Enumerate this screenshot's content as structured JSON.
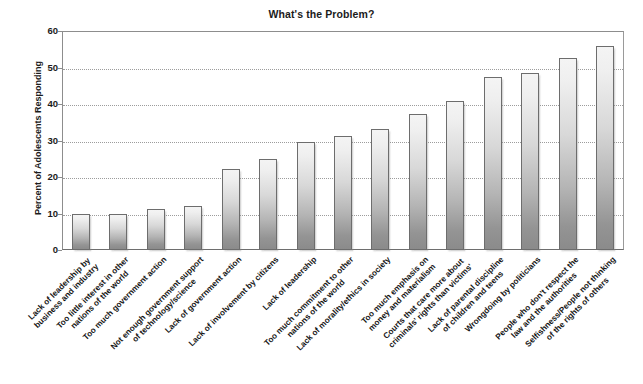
{
  "chart_data": {
    "type": "bar",
    "title": "What's the Problem?",
    "xlabel": "",
    "ylabel": "Percent of Adolescents Responding",
    "ylim": [
      0,
      60
    ],
    "ytick_step": 10,
    "yticks": [
      "60",
      "50",
      "40",
      "30",
      "20",
      "10",
      "0"
    ],
    "grid": "horizontal-dotted",
    "legend": "none",
    "categories": [
      "Lack of leadership by\nbusiness and industry",
      "Too little interest in other\nnations of the world",
      "Too much government action",
      "Not enough government support\nof technology/science",
      "Lack of government action",
      "Lack of involvement by citizens",
      "Lack of leadership",
      "Too much commitment to other\nnations of the world",
      "Lack of morality/ethics in society",
      "Too much emphasis on\nmoney and materialism",
      "Courts that care more about\ncriminals' rights than victims'",
      "Lack of parental discipline\nof children and teens",
      "Wrongdoing by politicians",
      "People who don't respect the\nlaw and the authorities",
      "Selfishness/People not thinking\nof the rights of others"
    ],
    "values": [
      9.8,
      10.0,
      11.3,
      12.0,
      22.3,
      24.8,
      29.7,
      31.2,
      33.2,
      37.3,
      40.8,
      47.5,
      48.5,
      52.5,
      56.0
    ],
    "bar_fill_top": "#f4f4f4",
    "bar_fill_bottom": "#8b8b8b",
    "bar_border": "#6d6d6d",
    "gridline_color": "#9c9c9c",
    "axis_color": "#8d8d8d",
    "background": "#ffffff"
  }
}
